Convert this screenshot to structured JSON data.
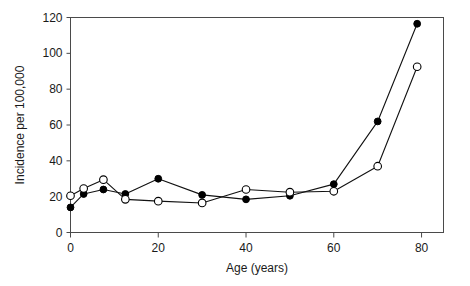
{
  "chart_data": {
    "type": "line",
    "title": "",
    "subtitle": "",
    "xlabel": "Age (years)",
    "ylabel": "Incidence per 100,000",
    "xlim": [
      0,
      85
    ],
    "ylim": [
      0,
      120
    ],
    "xticks": [
      0,
      20,
      40,
      60,
      80
    ],
    "xtick_labels": [
      "0",
      "20",
      "40",
      "60",
      "80"
    ],
    "yticks": [
      0,
      20,
      40,
      60,
      80,
      100,
      120
    ],
    "ytick_labels": [
      "0",
      "20",
      "40",
      "60",
      "80",
      "100",
      "120"
    ],
    "grid": false,
    "legend": "none",
    "annotations": [],
    "series": [
      {
        "name": "filled-circle-series",
        "marker": "filled-circle",
        "color": "#000000",
        "x": [
          0,
          3,
          7.5,
          12.5,
          20,
          30,
          40,
          50,
          60,
          70,
          79
        ],
        "values": [
          14,
          21.5,
          24,
          21.5,
          30,
          21,
          18.5,
          20.5,
          27,
          62,
          116.5
        ]
      },
      {
        "name": "open-circle-series",
        "marker": "open-circle",
        "color": "#000000",
        "x": [
          0,
          3,
          7.5,
          12.5,
          20,
          30,
          40,
          50,
          60,
          70,
          79
        ],
        "values": [
          20.5,
          24.5,
          29.5,
          18.5,
          17.5,
          16.5,
          24,
          22.5,
          23,
          37,
          92.5
        ]
      }
    ]
  },
  "figure": {
    "background_color": "#ffffff",
    "axis_color": "#4a4a4a",
    "text_color": "#1a1a1a"
  }
}
